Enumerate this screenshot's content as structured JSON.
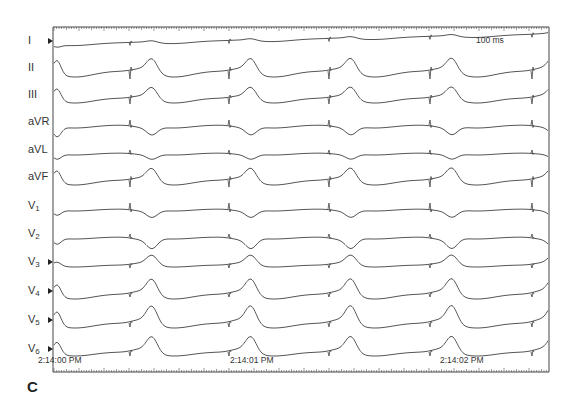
{
  "panel": {
    "letter": "C",
    "scale_label": "100 ms",
    "colors": {
      "trace": "#555555",
      "frame": "#444444",
      "background": "#ffffff"
    }
  },
  "leads": [
    {
      "id": "I",
      "label": "I",
      "sub": "",
      "marker": true
    },
    {
      "id": "II",
      "label": "II",
      "sub": "",
      "marker": false
    },
    {
      "id": "III",
      "label": "III",
      "sub": "",
      "marker": false
    },
    {
      "id": "aVR",
      "label": "aVR",
      "sub": "",
      "marker": false
    },
    {
      "id": "aVL",
      "label": "aVL",
      "sub": "",
      "marker": false
    },
    {
      "id": "aVF",
      "label": "aVF",
      "sub": "",
      "marker": false
    },
    {
      "id": "V1",
      "label": "V",
      "sub": "1",
      "marker": false
    },
    {
      "id": "V2",
      "label": "V",
      "sub": "2",
      "marker": false
    },
    {
      "id": "V3",
      "label": "V",
      "sub": "3",
      "marker": true
    },
    {
      "id": "V4",
      "label": "V",
      "sub": "4",
      "marker": true
    },
    {
      "id": "V5",
      "label": "V",
      "sub": "5",
      "marker": true
    },
    {
      "id": "V6",
      "label": "V",
      "sub": "6",
      "marker": true
    }
  ],
  "time_axis": {
    "labels": [
      "2:14:00 PM",
      "2:14:01 PM",
      "2:14:02 PM"
    ]
  }
}
